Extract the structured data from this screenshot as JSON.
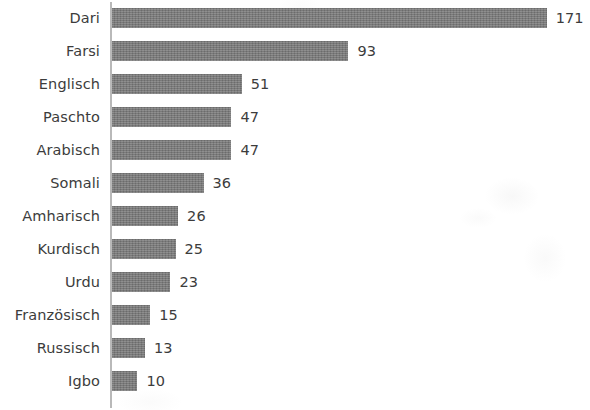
{
  "chart_data": {
    "type": "bar",
    "orientation": "horizontal",
    "title": "",
    "subtitle": "",
    "xlabel": "",
    "ylabel": "",
    "grid": false,
    "legend": null,
    "legend_position": "none",
    "xlim": [
      0,
      171
    ],
    "categories": [
      "Dari",
      "Farsi",
      "Englisch",
      "Paschto",
      "Arabisch",
      "Somali",
      "Amharisch",
      "Kurdisch",
      "Urdu",
      "Französisch",
      "Russisch",
      "Igbo"
    ],
    "values": [
      171,
      93,
      51,
      47,
      47,
      36,
      26,
      25,
      23,
      15,
      13,
      10
    ],
    "value_labels": [
      "171",
      "93",
      "51",
      "47",
      "47",
      "36",
      "26",
      "25",
      "23",
      "15",
      "13",
      "10"
    ],
    "bar_color": "#787878",
    "text_color": "#3c3c3c",
    "axis_color": "#b9b9b9",
    "background_color": "#ffffff"
  }
}
